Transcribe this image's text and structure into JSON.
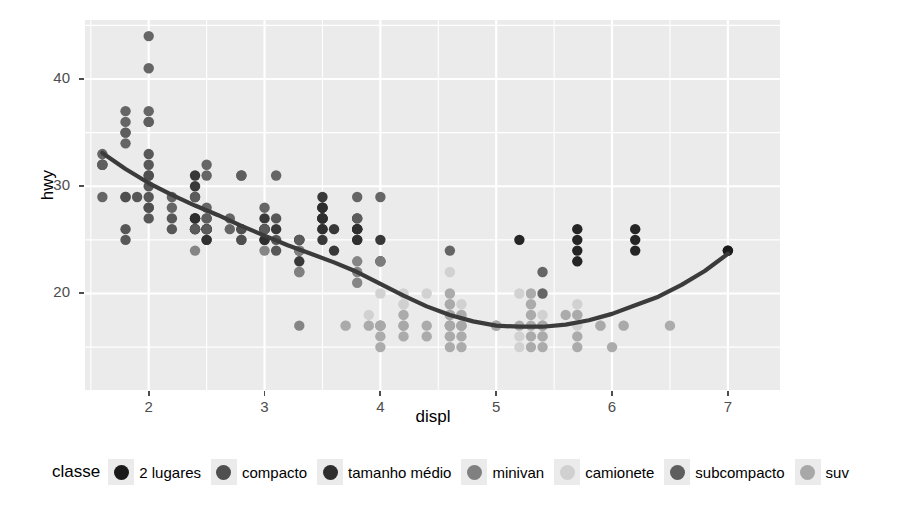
{
  "chart_data": {
    "type": "scatter",
    "title": "",
    "xlabel": "displ",
    "ylabel": "hwy",
    "xlim": [
      1.45,
      7.45
    ],
    "ylim": [
      11.0,
      45.5
    ],
    "xticks": [
      2,
      3,
      4,
      5,
      6,
      7
    ],
    "yticks": [
      20,
      30,
      40
    ],
    "grid": true,
    "legend_position": "bottom",
    "legend_title": "classe",
    "panel_background": "#ebebeb",
    "gridline_color": "#ffffff",
    "smooth_line_color": "#3b3b3b",
    "series": [
      {
        "name": "2 lugares",
        "color": "#1a1a1a",
        "points": [
          [
            5.7,
            26
          ],
          [
            5.7,
            23
          ],
          [
            6.2,
            26
          ],
          [
            6.2,
            25
          ],
          [
            7.0,
            24
          ],
          [
            5.2,
            25
          ],
          [
            5.7,
            24
          ],
          [
            6.2,
            24
          ],
          [
            7.0,
            24
          ],
          [
            5.7,
            25
          ]
        ]
      },
      {
        "name": "compacto",
        "color": "#4f4f4f",
        "points": [
          [
            1.8,
            29
          ],
          [
            1.8,
            29
          ],
          [
            2.0,
            31
          ],
          [
            2.0,
            30
          ],
          [
            2.8,
            26
          ],
          [
            2.8,
            26
          ],
          [
            3.1,
            27
          ],
          [
            1.8,
            26
          ],
          [
            1.8,
            25
          ],
          [
            2.0,
            28
          ],
          [
            2.0,
            27
          ],
          [
            2.8,
            25
          ],
          [
            2.8,
            25
          ],
          [
            3.1,
            25
          ],
          [
            3.1,
            24
          ],
          [
            2.4,
            27
          ],
          [
            2.4,
            26
          ],
          [
            2.5,
            26
          ],
          [
            2.5,
            26
          ],
          [
            3.3,
            24
          ],
          [
            2.0,
            29
          ],
          [
            2.0,
            31
          ],
          [
            2.5,
            26
          ],
          [
            2.5,
            27
          ],
          [
            2.2,
            26
          ],
          [
            2.2,
            27
          ],
          [
            1.9,
            29
          ],
          [
            2.0,
            28
          ],
          [
            2.4,
            27
          ],
          [
            2.4,
            26
          ],
          [
            2.5,
            25
          ],
          [
            2.5,
            26
          ],
          [
            2.0,
            33
          ],
          [
            2.0,
            32
          ]
        ]
      },
      {
        "name": "tamanho médio",
        "color": "#2e2e2e",
        "points": [
          [
            2.4,
            29
          ],
          [
            2.4,
            27
          ],
          [
            3.1,
            26
          ],
          [
            3.5,
            28
          ],
          [
            3.6,
            26
          ],
          [
            2.4,
            27
          ],
          [
            3.0,
            26
          ],
          [
            3.3,
            25
          ],
          [
            3.3,
            25
          ],
          [
            3.8,
            26
          ],
          [
            3.8,
            26
          ],
          [
            3.8,
            27
          ],
          [
            4.0,
            25
          ],
          [
            3.5,
            29
          ],
          [
            3.5,
            27
          ],
          [
            3.5,
            28
          ],
          [
            3.0,
            26
          ],
          [
            3.5,
            25
          ],
          [
            3.8,
            25
          ],
          [
            3.0,
            27
          ],
          [
            2.5,
            25
          ],
          [
            2.5,
            26
          ],
          [
            3.5,
            26
          ],
          [
            3.5,
            27
          ],
          [
            3.0,
            25
          ],
          [
            2.4,
            31
          ],
          [
            2.4,
            30
          ],
          [
            3.0,
            26
          ],
          [
            3.5,
            26
          ],
          [
            3.5,
            27
          ],
          [
            3.6,
            24
          ],
          [
            2.4,
            26
          ],
          [
            3.0,
            25
          ],
          [
            3.3,
            23
          ],
          [
            3.8,
            26
          ],
          [
            4.0,
            23
          ],
          [
            3.5,
            27
          ],
          [
            3.5,
            28
          ],
          [
            3.8,
            25
          ]
        ]
      },
      {
        "name": "minivan",
        "color": "#808080",
        "points": [
          [
            2.4,
            24
          ],
          [
            3.0,
            24
          ],
          [
            3.3,
            22
          ],
          [
            3.3,
            22
          ],
          [
            3.3,
            24
          ],
          [
            3.3,
            24
          ],
          [
            3.3,
            17
          ],
          [
            3.8,
            22
          ],
          [
            3.8,
            21
          ],
          [
            3.8,
            23
          ],
          [
            4.0,
            23
          ]
        ]
      },
      {
        "name": "camionete",
        "color": "#d0d0d0",
        "points": [
          [
            5.2,
            20
          ],
          [
            5.7,
            17
          ],
          [
            5.9,
            17
          ],
          [
            4.7,
            19
          ],
          [
            5.7,
            19
          ],
          [
            6.1,
            17
          ],
          [
            4.0,
            20
          ],
          [
            4.2,
            20
          ],
          [
            4.4,
            20
          ],
          [
            4.6,
            22
          ],
          [
            5.4,
            17
          ],
          [
            5.4,
            17
          ],
          [
            4.0,
            17
          ],
          [
            4.0,
            17
          ],
          [
            4.6,
            17
          ],
          [
            5.0,
            17
          ],
          [
            4.2,
            19
          ],
          [
            4.2,
            19
          ],
          [
            4.6,
            19
          ],
          [
            4.6,
            18
          ],
          [
            4.6,
            17
          ],
          [
            5.4,
            17
          ],
          [
            5.4,
            18
          ],
          [
            3.7,
            17
          ],
          [
            3.9,
            17
          ],
          [
            3.9,
            18
          ],
          [
            4.7,
            18
          ],
          [
            4.7,
            17
          ],
          [
            4.7,
            17
          ],
          [
            5.2,
            16
          ],
          [
            5.2,
            15
          ],
          [
            5.7,
            18
          ],
          [
            5.9,
            17
          ],
          [
            4.6,
            16
          ],
          [
            5.4,
            16
          ]
        ]
      },
      {
        "name": "subcompacto",
        "color": "#5e5e5e",
        "points": [
          [
            1.8,
            35
          ],
          [
            1.8,
            37
          ],
          [
            1.8,
            35
          ],
          [
            2.0,
            37
          ],
          [
            2.0,
            36
          ],
          [
            2.8,
            31
          ],
          [
            2.8,
            31
          ],
          [
            3.1,
            31
          ],
          [
            1.6,
            33
          ],
          [
            1.6,
            32
          ],
          [
            1.6,
            32
          ],
          [
            1.6,
            29
          ],
          [
            1.6,
            32
          ],
          [
            1.8,
            34
          ],
          [
            1.8,
            36
          ],
          [
            2.0,
            36
          ],
          [
            2.4,
            29
          ],
          [
            2.4,
            26
          ],
          [
            2.5,
            26
          ],
          [
            2.5,
            28
          ],
          [
            3.3,
            25
          ],
          [
            2.0,
            44
          ],
          [
            2.0,
            41
          ],
          [
            2.5,
            32
          ],
          [
            2.5,
            31
          ],
          [
            2.7,
            26
          ],
          [
            2.7,
            27
          ],
          [
            3.0,
            28
          ],
          [
            3.8,
            29
          ],
          [
            3.8,
            27
          ],
          [
            4.0,
            29
          ],
          [
            4.6,
            24
          ],
          [
            5.4,
            20
          ],
          [
            5.4,
            22
          ],
          [
            2.2,
            29
          ],
          [
            2.2,
            28
          ],
          [
            2.5,
            27
          ],
          [
            3.0,
            26
          ]
        ]
      },
      {
        "name": "suv",
        "color": "#a8a8a8",
        "points": [
          [
            4.0,
            17
          ],
          [
            4.0,
            17
          ],
          [
            4.0,
            15
          ],
          [
            4.6,
            15
          ],
          [
            5.0,
            17
          ],
          [
            4.2,
            17
          ],
          [
            4.4,
            16
          ],
          [
            4.6,
            17
          ],
          [
            5.4,
            15
          ],
          [
            5.4,
            17
          ],
          [
            4.0,
            17
          ],
          [
            4.0,
            16
          ],
          [
            4.6,
            17
          ],
          [
            5.0,
            17
          ],
          [
            4.2,
            18
          ],
          [
            4.2,
            17
          ],
          [
            4.6,
            18
          ],
          [
            4.6,
            17
          ],
          [
            5.4,
            17
          ],
          [
            5.4,
            16
          ],
          [
            3.7,
            17
          ],
          [
            3.9,
            17
          ],
          [
            4.7,
            17
          ],
          [
            4.7,
            18
          ],
          [
            5.2,
            17
          ],
          [
            5.7,
            18
          ],
          [
            5.9,
            17
          ],
          [
            6.5,
            17
          ],
          [
            4.6,
            19
          ],
          [
            4.6,
            20
          ],
          [
            4.6,
            18
          ],
          [
            5.3,
            20
          ],
          [
            5.3,
            19
          ],
          [
            5.3,
            18
          ],
          [
            5.3,
            17
          ],
          [
            5.3,
            16
          ],
          [
            5.3,
            15
          ],
          [
            5.7,
            15
          ],
          [
            5.7,
            16
          ],
          [
            6.1,
            17
          ],
          [
            6.0,
            15
          ],
          [
            5.6,
            18
          ],
          [
            4.7,
            16
          ],
          [
            4.7,
            17
          ],
          [
            4.7,
            15
          ],
          [
            4.6,
            16
          ],
          [
            4.4,
            17
          ],
          [
            4.2,
            16
          ]
        ]
      }
    ],
    "smooth_curve": [
      [
        1.6,
        33.1
      ],
      [
        1.8,
        31.6
      ],
      [
        2.0,
        30.3
      ],
      [
        2.2,
        29.2
      ],
      [
        2.4,
        28.2
      ],
      [
        2.6,
        27.3
      ],
      [
        2.8,
        26.3
      ],
      [
        3.0,
        25.4
      ],
      [
        3.2,
        24.5
      ],
      [
        3.4,
        23.7
      ],
      [
        3.6,
        22.9
      ],
      [
        3.8,
        22.0
      ],
      [
        4.0,
        20.9
      ],
      [
        4.2,
        19.8
      ],
      [
        4.4,
        18.8
      ],
      [
        4.6,
        18.0
      ],
      [
        4.8,
        17.4
      ],
      [
        5.0,
        17.0
      ],
      [
        5.2,
        16.9
      ],
      [
        5.4,
        16.9
      ],
      [
        5.6,
        17.1
      ],
      [
        5.8,
        17.5
      ],
      [
        6.0,
        18.1
      ],
      [
        6.2,
        18.9
      ],
      [
        6.4,
        19.7
      ],
      [
        6.6,
        20.8
      ],
      [
        6.8,
        22.1
      ],
      [
        7.0,
        23.7
      ]
    ]
  },
  "axes": {
    "y_title": "hwy",
    "x_title": "displ",
    "y_tick_labels": [
      "20",
      "30",
      "40"
    ],
    "x_tick_labels": [
      "2",
      "3",
      "4",
      "5",
      "6",
      "7"
    ]
  },
  "legend": {
    "title": "classe",
    "items": [
      {
        "label": "2 lugares",
        "color": "#1a1a1a"
      },
      {
        "label": "compacto",
        "color": "#4f4f4f"
      },
      {
        "label": "tamanho médio",
        "color": "#2e2e2e"
      },
      {
        "label": "minivan",
        "color": "#808080"
      },
      {
        "label": "camionete",
        "color": "#d0d0d0"
      },
      {
        "label": "subcompacto",
        "color": "#5e5e5e"
      },
      {
        "label": "suv",
        "color": "#a8a8a8"
      }
    ]
  }
}
